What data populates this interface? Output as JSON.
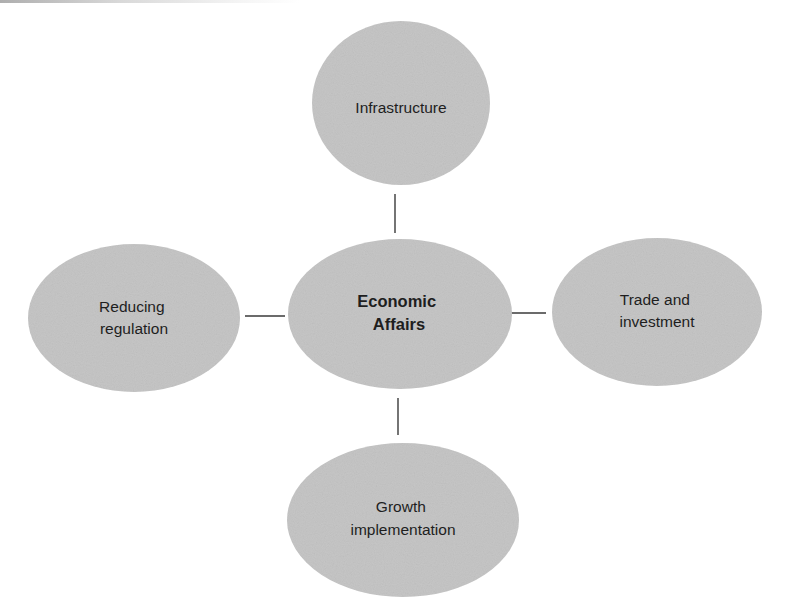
{
  "diagram": {
    "type": "hub-and-spoke",
    "center": {
      "id": "economic-affairs",
      "lines": [
        "Economic",
        "Affairs"
      ],
      "bold": true
    },
    "nodes": [
      {
        "id": "infrastructure",
        "position": "top",
        "lines": [
          "Infrastructure"
        ]
      },
      {
        "id": "reducing-regulation",
        "position": "left",
        "lines": [
          "Reducing",
          "regulation"
        ]
      },
      {
        "id": "trade-and-investment",
        "position": "right",
        "lines": [
          "Trade and",
          "investment"
        ]
      },
      {
        "id": "growth-implementation",
        "position": "bottom",
        "lines": [
          "Growth",
          "implementation"
        ]
      }
    ],
    "edges": [
      {
        "from": "economic-affairs",
        "to": "infrastructure"
      },
      {
        "from": "economic-affairs",
        "to": "reducing-regulation"
      },
      {
        "from": "economic-affairs",
        "to": "trade-and-investment"
      },
      {
        "from": "economic-affairs",
        "to": "growth-implementation"
      }
    ],
    "colors": {
      "ellipse_fill": "#c6c6c6",
      "text": "#1e1e1e",
      "connector": "#3a3a3a",
      "background": "#ffffff"
    }
  }
}
